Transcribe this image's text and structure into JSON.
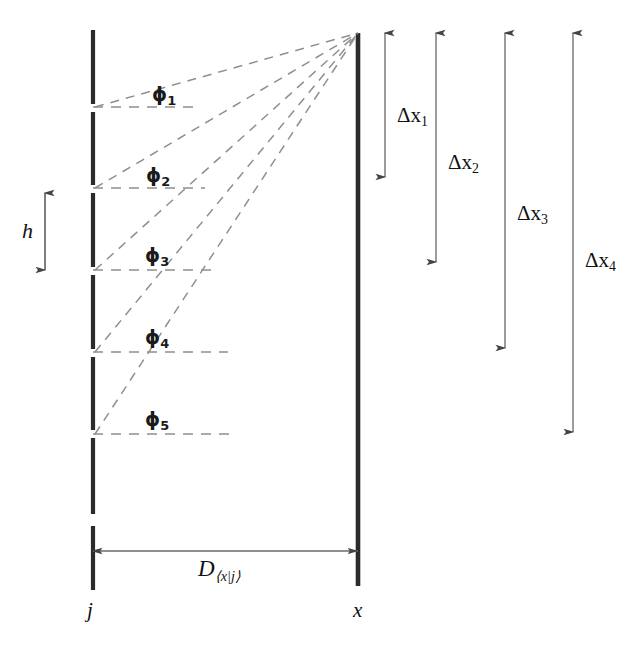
{
  "figure": {
    "background_color": "#ffffff",
    "line_color": "#2b2b2b",
    "dash_color": "#8a8a8a",
    "arrow_color": "#555555",
    "width": 638,
    "height": 657
  },
  "axes": {
    "left_label": "j",
    "right_label": "x",
    "left_x": 93,
    "right_x": 358
  },
  "segment_height_label": {
    "symbol": "h",
    "arrow_top": 193,
    "arrow_bottom": 270
  },
  "distance_label": {
    "symbol": "D",
    "subscript": "⟨x|j⟩",
    "subscript_parts": {
      "open": "⟨",
      "num": "x",
      "bar": "|",
      "den": "j",
      "close": "⟩"
    },
    "arrow_y": 551
  },
  "angles": [
    {
      "label": "ϕ",
      "subscript": "1",
      "x": 152,
      "y": 85,
      "vertex_y": 108
    },
    {
      "label": "ϕ",
      "subscript": "2",
      "x": 146,
      "y": 166,
      "vertex_y": 189
    },
    {
      "label": "ϕ",
      "subscript": "3",
      "x": 145,
      "y": 246,
      "vertex_y": 271
    },
    {
      "label": "ϕ",
      "subscript": "4",
      "x": 145,
      "y": 328,
      "vertex_y": 353
    },
    {
      "label": "ϕ",
      "subscript": "5",
      "x": 145,
      "y": 410,
      "vertex_y": 434
    }
  ],
  "delta_x_arrows": [
    {
      "label": "Δx",
      "subscript": "1",
      "x": 385,
      "top": 33,
      "bottom": 177,
      "text_x": 397,
      "text_y": 105
    },
    {
      "label": "Δx",
      "subscript": "2",
      "x": 436,
      "top": 33,
      "bottom": 262,
      "text_x": 448,
      "text_y": 152
    },
    {
      "label": "Δx",
      "subscript": "3",
      "x": 505,
      "top": 33,
      "bottom": 348,
      "text_x": 517,
      "text_y": 203
    },
    {
      "label": "Δx",
      "subscript": "4",
      "x": 573,
      "top": 33,
      "bottom": 432,
      "text_x": 585,
      "text_y": 250
    }
  ],
  "apex": {
    "x": 358,
    "y": 33
  },
  "left_column_segments": [
    {
      "top": 30,
      "bottom": 104
    },
    {
      "top": 112,
      "bottom": 185
    },
    {
      "top": 193,
      "bottom": 267
    },
    {
      "top": 275,
      "bottom": 349
    },
    {
      "top": 357,
      "bottom": 430
    },
    {
      "top": 438,
      "bottom": 514
    },
    {
      "top": 526,
      "bottom": 590
    }
  ],
  "right_column": {
    "top": 33,
    "bottom": 586
  },
  "horizontal_dashes": [
    {
      "y": 107,
      "x1": 93,
      "x2": 197
    },
    {
      "y": 188,
      "x1": 93,
      "x2": 205
    },
    {
      "y": 270,
      "x1": 93,
      "x2": 213
    },
    {
      "y": 352,
      "x1": 93,
      "x2": 228
    },
    {
      "y": 434,
      "x1": 93,
      "x2": 237
    }
  ]
}
